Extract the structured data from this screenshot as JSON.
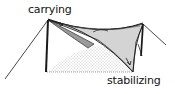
{
  "diagram": {
    "labels": {
      "carrying": "carrying",
      "stabilizing": "stabilizing"
    },
    "colors": {
      "line": "#1a1a1a",
      "membrane_light": "#d4d4d4",
      "membrane_dark": "#9a9a9a",
      "ground_dots": "#7a7a7a",
      "background": "#ffffff"
    }
  }
}
